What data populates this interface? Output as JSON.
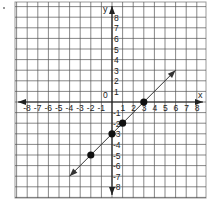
{
  "chart_data": {
    "type": "line",
    "title": "",
    "xlabel": "x",
    "ylabel": "y",
    "origin_label": "0",
    "xlim": [
      -9,
      9
    ],
    "ylim": [
      -9,
      9
    ],
    "grid": true,
    "x_ticks": [
      -8,
      -7,
      -6,
      -5,
      -4,
      -3,
      -2,
      -1,
      1,
      2,
      3,
      4,
      5,
      6,
      7,
      8
    ],
    "y_ticks": [
      8,
      7,
      6,
      5,
      4,
      3,
      2,
      1,
      -1,
      -2,
      -3,
      -4,
      -5,
      -6,
      -7,
      -8
    ],
    "series": [
      {
        "name": "line",
        "equation": "y = x - 3",
        "x": [
          -4,
          6
        ],
        "y": [
          -7,
          3
        ],
        "arrows": "both"
      }
    ],
    "points": [
      {
        "x": 3,
        "y": 0
      },
      {
        "x": 1,
        "y": -2
      },
      {
        "x": 0,
        "y": -3
      },
      {
        "x": -2,
        "y": -5
      }
    ],
    "colors": {
      "grid": "#555555",
      "axis": "#222222",
      "line": "#333333",
      "point": "#111111"
    }
  }
}
